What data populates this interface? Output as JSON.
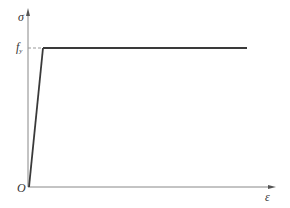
{
  "diagram": {
    "type": "elastic-perfectly-plastic stress-strain curve",
    "y_axis_label": "σ",
    "x_axis_label": "ε",
    "origin_label": "O",
    "yield_label_main": "f",
    "yield_label_sub": "y",
    "colors": {
      "axis": "#777777",
      "curve": "#3a3a3a",
      "dashed": "#999999",
      "text": "#333333"
    }
  }
}
